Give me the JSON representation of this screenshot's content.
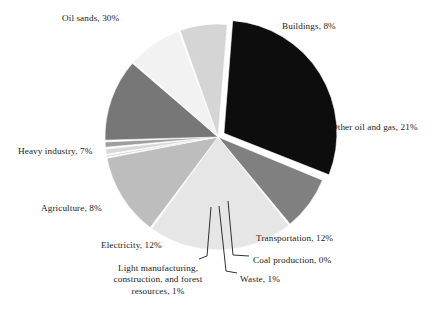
{
  "chart_data": {
    "type": "pie",
    "title": "",
    "subtitle": "",
    "xlabel": "",
    "ylabel": "",
    "legend_position": "none",
    "grid": false,
    "units": "percent of total emissions",
    "total": 100,
    "categories": [
      "Oil sands",
      "Buildings",
      "Other oil and gas",
      "Transportation",
      "Coal production",
      "Waste",
      "Light manufacturing, construction, and forest resources",
      "Electricity",
      "Agriculture",
      "Heavy industry"
    ],
    "values": [
      30,
      8,
      21,
      12,
      0,
      1,
      1,
      12,
      8,
      7
    ],
    "slices": [
      {
        "name": "Oil sands",
        "value": 30,
        "label": "Oil sands, 30%",
        "color": "#0d0d0d",
        "exploded": true
      },
      {
        "name": "Buildings",
        "value": 8,
        "label": "Buildings, 8%",
        "color": "#808080",
        "exploded": false
      },
      {
        "name": "Other oil and gas",
        "value": 21,
        "label": "Other oil and gas, 21%",
        "color": "#e6e6e6",
        "exploded": false
      },
      {
        "name": "Transportation",
        "value": 12,
        "label": "Transportation, 12%",
        "color": "#bdbdbd",
        "exploded": false
      },
      {
        "name": "Coal production",
        "value": 0,
        "label": "Coal production, 0%",
        "color": "#1a1a1a",
        "exploded": false
      },
      {
        "name": "Waste",
        "value": 1,
        "label": "Waste, 1%",
        "color": "#d9d9d9",
        "exploded": false
      },
      {
        "name": "Light manufacturing, construction, and forest resources",
        "value": 1,
        "label": "Light manufacturing, construction, and forest resources, 1%",
        "label_line_1": "Light manufacturing,",
        "label_line_2": "construction, and forest",
        "label_line_3": "resources, 1%",
        "color": "#9e9e9e",
        "exploded": false
      },
      {
        "name": "Electricity",
        "value": 12,
        "label": "Electricity, 12%",
        "color": "#777777",
        "exploded": false
      },
      {
        "name": "Agriculture",
        "value": 8,
        "label": "Agriculture, 8%",
        "color": "#f2f2f2",
        "exploded": false
      },
      {
        "name": "Heavy industry",
        "value": 7,
        "label": "Heavy industry, 7%",
        "color": "#d5d5d5",
        "exploded": false
      }
    ]
  },
  "labels": {
    "oil_sands": "Oil sands, 30%",
    "buildings": "Buildings, 8%",
    "other_oil_and_gas": "Other oil and gas, 21%",
    "transportation": "Transportation, 12%",
    "coal_production": "Coal production, 0%",
    "waste": "Waste, 1%",
    "light_manufacturing_l1": "Light manufacturing,",
    "light_manufacturing_l2": "construction, and forest",
    "light_manufacturing_l3": "resources, 1%",
    "electricity": "Electricity, 12%",
    "agriculture": "Agriculture, 8%",
    "heavy_industry": "Heavy industry, 7%"
  }
}
